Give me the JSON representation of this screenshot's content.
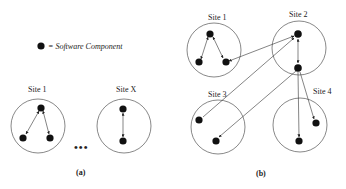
{
  "legend": {
    "symbol": "filled-circle",
    "text": "= Software Component"
  },
  "panel_a": {
    "caption": "(a)",
    "ellipsis": "•••",
    "sites": [
      {
        "label": "Site 1",
        "components": 3,
        "connections": [
          [
            "top",
            "bottom-left"
          ],
          [
            "top",
            "bottom-right"
          ]
        ]
      },
      {
        "label": "Site X",
        "components": 2,
        "connections": [
          [
            "top",
            "bottom"
          ]
        ]
      }
    ]
  },
  "panel_b": {
    "caption": "(b)",
    "sites": [
      {
        "label": "Site 1",
        "components": 3
      },
      {
        "label": "Site 2",
        "components": 2
      },
      {
        "label": "Site 3",
        "components": 2
      },
      {
        "label": "Site 4",
        "components": 2
      }
    ],
    "inter_site_connections": [
      [
        "Site 1 bottom-right",
        "Site 2 top"
      ],
      [
        "Site 3 left",
        "Site 2 top"
      ],
      [
        "Site 2 middle",
        "Site 3 bottom"
      ],
      [
        "Site 2 middle",
        "Site 4 bottom-left"
      ],
      [
        "Site 2 middle",
        "Site 4 right"
      ]
    ]
  },
  "colors": {
    "node": "#111111",
    "circle_stroke": "#555555",
    "edge": "#333333",
    "background": "#ffffff"
  }
}
